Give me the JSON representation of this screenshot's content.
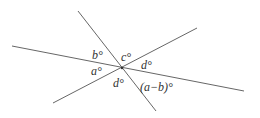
{
  "diagram": {
    "lines": [
      {
        "id": "line-1",
        "x1": 12,
        "y1": 46,
        "x2": 244,
        "y2": 91
      },
      {
        "id": "line-2",
        "x1": 78,
        "y1": 11,
        "x2": 156,
        "y2": 111
      },
      {
        "id": "line-3",
        "x1": 53,
        "y1": 103,
        "x2": 197,
        "y2": 28
      }
    ],
    "intersection": {
      "x": 122,
      "y": 68
    },
    "labels": {
      "b": "b°",
      "c": "c°",
      "a": "a°",
      "d_right": "d°",
      "d_bottom": "d°",
      "a_minus_b": "(a−b)°"
    },
    "line_color": "#555555"
  }
}
